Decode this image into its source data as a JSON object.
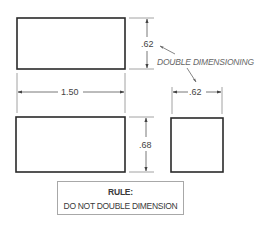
{
  "diagram": {
    "parts": [
      {
        "id": "top-rect",
        "x": 17,
        "y": 18,
        "w": 108,
        "h": 51
      },
      {
        "id": "bottom-rect",
        "x": 16,
        "y": 117,
        "w": 109,
        "h": 55
      },
      {
        "id": "square",
        "x": 171,
        "y": 118,
        "w": 52,
        "h": 54
      }
    ],
    "dimensions": {
      "top_height": ".62",
      "width": "1.50",
      "bottom_height": ".68",
      "square_width": ".62"
    },
    "callout": "DOUBLE DIMENSIONING",
    "rule": {
      "title": "RULE:",
      "text": "DO NOT DOUBLE DIMENSION"
    }
  }
}
